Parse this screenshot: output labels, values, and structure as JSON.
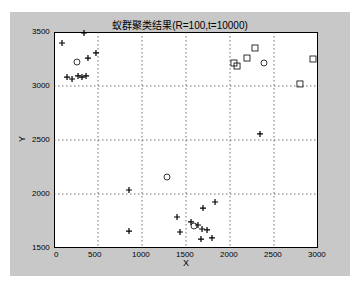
{
  "chart_data": {
    "type": "scatter",
    "title": "蚁群聚类结果(R=100,t=10000)",
    "xlabel": "X",
    "ylabel": "Y",
    "xlim": [
      0,
      3000
    ],
    "ylim": [
      1500,
      3500
    ],
    "xticks": [
      "0",
      "500",
      "1000",
      "1500",
      "2000",
      "2500",
      "3000"
    ],
    "yticks": [
      "1500",
      "2000",
      "2500",
      "3000",
      "3500"
    ],
    "grid": true,
    "series": [
      {
        "name": "cluster-plus",
        "marker": "+",
        "points": [
          [
            91,
            3398
          ],
          [
            341,
            3491
          ],
          [
            477,
            3306
          ],
          [
            386,
            3259
          ],
          [
            148,
            3083
          ],
          [
            205,
            3065
          ],
          [
            273,
            3093
          ],
          [
            318,
            3083
          ],
          [
            364,
            3093
          ],
          [
            2341,
            2556
          ],
          [
            852,
            2037
          ],
          [
            852,
            1657
          ],
          [
            1398,
            1787
          ],
          [
            1432,
            1648
          ],
          [
            1557,
            1741
          ],
          [
            1636,
            1713
          ],
          [
            1682,
            1676
          ],
          [
            1739,
            1667
          ],
          [
            1830,
            1926
          ],
          [
            1693,
            1870
          ],
          [
            1670,
            1583
          ],
          [
            1795,
            1593
          ]
        ]
      },
      {
        "name": "cluster-square",
        "marker": "s",
        "points": [
          [
            2045,
            3213
          ],
          [
            2080,
            3185
          ],
          [
            2193,
            3259
          ],
          [
            2284,
            3352
          ],
          [
            2943,
            3250
          ],
          [
            2795,
            3019
          ]
        ]
      },
      {
        "name": "centers",
        "marker": "o",
        "points": [
          [
            261,
            3222
          ],
          [
            2386,
            3213
          ],
          [
            1284,
            2157
          ],
          [
            1591,
            1704
          ]
        ]
      }
    ]
  }
}
